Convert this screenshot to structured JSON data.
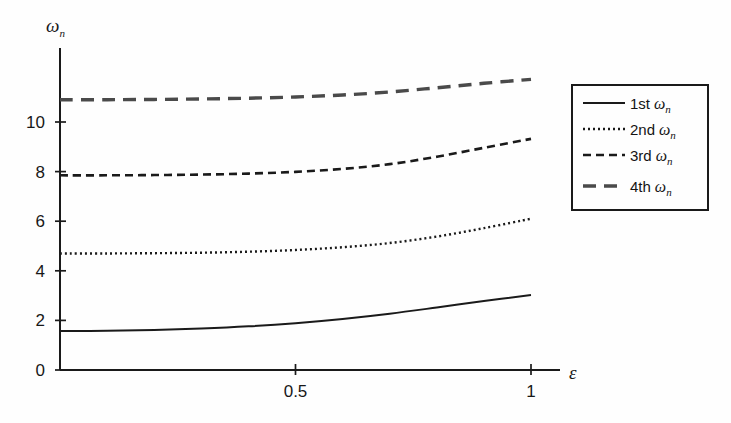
{
  "chart_data": {
    "type": "line",
    "title": "",
    "subtitle": "",
    "xlabel": "ε",
    "ylabel": "ωn",
    "xlim": [
      0,
      1.06
    ],
    "ylim": [
      0,
      12.4
    ],
    "xticks": [
      0.5,
      1
    ],
    "xtick_labels": [
      "0.5",
      "1"
    ],
    "yticks": [
      0,
      2,
      4,
      6,
      8,
      10
    ],
    "ytick_labels": [
      "0",
      "2",
      "4",
      "6",
      "8",
      "10"
    ],
    "grid": false,
    "legend_position": "right-outside",
    "x": [
      0,
      0.1,
      0.2,
      0.3,
      0.4,
      0.5,
      0.6,
      0.7,
      0.8,
      0.9,
      1.0
    ],
    "series": [
      {
        "name": "1st ωn",
        "style": "solid",
        "color": "#1a1a1a",
        "values": [
          1.57,
          1.58,
          1.61,
          1.67,
          1.76,
          1.89,
          2.06,
          2.27,
          2.52,
          2.78,
          3.02
        ]
      },
      {
        "name": "2nd ωn",
        "style": "dotted",
        "color": "#1a1a1a",
        "values": [
          4.7,
          4.7,
          4.71,
          4.73,
          4.77,
          4.84,
          4.95,
          5.12,
          5.38,
          5.72,
          6.1
        ]
      },
      {
        "name": "3rd ωn",
        "style": "dashed",
        "color": "#1a1a1a",
        "values": [
          7.85,
          7.85,
          7.86,
          7.88,
          7.92,
          7.99,
          8.11,
          8.3,
          8.6,
          8.96,
          9.32
        ]
      },
      {
        "name": "4th ωn",
        "style": "longdash",
        "color": "#4a4a4a",
        "values": [
          10.9,
          10.9,
          10.91,
          10.93,
          10.96,
          11.01,
          11.09,
          11.21,
          11.38,
          11.56,
          11.72
        ]
      }
    ]
  },
  "axes": {
    "y_label_main": "ω",
    "y_label_sub": "n",
    "x_label": "ε"
  },
  "legend": {
    "items": [
      {
        "rank": "1st",
        "omega": "ω",
        "sub": "n",
        "style": "solid"
      },
      {
        "rank": "2nd",
        "omega": "ω",
        "sub": "n",
        "style": "dotted"
      },
      {
        "rank": "3rd",
        "omega": "ω",
        "sub": "n",
        "style": "dashed"
      },
      {
        "rank": "4th",
        "omega": "ω",
        "sub": "n",
        "style": "longdash"
      }
    ]
  }
}
